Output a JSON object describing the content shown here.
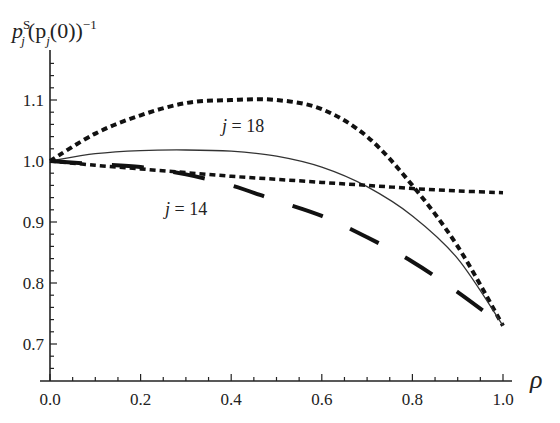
{
  "chart_data": {
    "type": "line",
    "title": "",
    "ylabel": "p_j^S (p_j(0))^-1",
    "ylabel_parts": {
      "base": "p",
      "sub": "j",
      "sup": "S",
      "rest": "(p",
      "rest_sub": "j",
      "rest2": "(0))",
      "rest_sup": "−1"
    },
    "xlabel": "ρ",
    "xlim": [
      0.0,
      1.0
    ],
    "ylim": [
      0.65,
      1.15
    ],
    "grid": false,
    "legend": "none",
    "x_ticks": [
      "0.0",
      "0.2",
      "0.4",
      "0.6",
      "0.8",
      "1.0"
    ],
    "y_ticks": [
      "0.7",
      "0.8",
      "0.9",
      "1.0",
      "1.1"
    ],
    "x": [
      0.0,
      0.1,
      0.2,
      0.3,
      0.4,
      0.5,
      0.6,
      0.7,
      0.8,
      0.9,
      1.0
    ],
    "series": [
      {
        "name": "j = 18 (dotted, bulging)",
        "style": "dotted-thick",
        "values": [
          1.0,
          1.045,
          1.075,
          1.095,
          1.1,
          1.1,
          1.085,
          1.04,
          0.96,
          0.86,
          0.73
        ]
      },
      {
        "name": "solid thin",
        "style": "solid-thin",
        "values": [
          1.0,
          1.012,
          1.017,
          1.018,
          1.016,
          1.008,
          0.99,
          0.958,
          0.91,
          0.84,
          0.73
        ]
      },
      {
        "name": "long dashed",
        "style": "long-dash",
        "values": [
          1.0,
          0.995,
          0.99,
          0.978,
          0.96,
          0.935,
          0.91,
          0.875,
          0.835,
          0.785,
          0.73
        ]
      },
      {
        "name": "j = 14 (dotted, flat)",
        "style": "dotted-flat",
        "values": [
          1.0,
          0.993,
          0.987,
          0.981,
          0.975,
          0.97,
          0.965,
          0.96,
          0.955,
          0.951,
          0.948
        ]
      }
    ],
    "annotations": [
      {
        "text": "j = 18",
        "x": 0.45,
        "y": 1.05
      },
      {
        "text": "j = 14",
        "x": 0.28,
        "y": 0.925
      }
    ]
  },
  "labels": {
    "annot_18_j": "j",
    "annot_18_rest": " = 18",
    "annot_14_j": "j",
    "annot_14_rest": " = 14"
  }
}
